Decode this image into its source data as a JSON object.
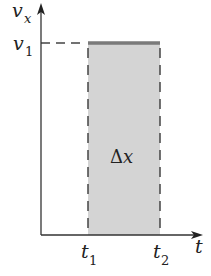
{
  "diagram": {
    "y_axis": {
      "label": "v",
      "subscript": "x"
    },
    "x_axis": {
      "label": "t"
    },
    "y_tick": {
      "label": "v",
      "subscript": "1"
    },
    "x_ticks": [
      {
        "label": "t",
        "subscript": "1"
      },
      {
        "label": "t",
        "subscript": "2"
      }
    ],
    "area_label": {
      "symbol": "Δ",
      "var": "x"
    },
    "colors": {
      "axis": "#333333",
      "area_fill": "#d4d4d4",
      "top_line": "#7a7a7a",
      "dash": "#444444"
    }
  }
}
